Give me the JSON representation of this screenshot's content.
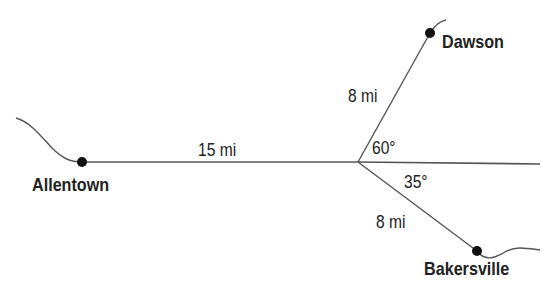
{
  "diagram": {
    "towns": [
      {
        "name": "Allentown"
      },
      {
        "name": "Dawson"
      },
      {
        "name": "Bakersville"
      }
    ],
    "distances": {
      "allentown_to_junction": "15 mi",
      "junction_to_dawson": "8 mi",
      "junction_to_bakersville": "8 mi"
    },
    "angles": {
      "dawson_angle": "60°",
      "bakersville_angle": "35°"
    },
    "colors": {
      "line": "#555555",
      "dot": "#111111",
      "text": "#222222"
    }
  }
}
